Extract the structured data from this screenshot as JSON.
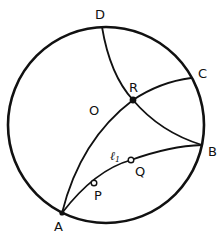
{
  "diagram": {
    "type": "hyperbolic-geometry-poincare-disk",
    "circle": {
      "cx": 106,
      "cy": 125,
      "r": 98,
      "stroke": "#111111",
      "stroke_width": 2.6
    },
    "points": {
      "A": {
        "label": "A",
        "x": 62,
        "y": 213,
        "lx": 54,
        "ly": 231
      },
      "B": {
        "label": "B",
        "x": 202,
        "y": 145,
        "lx": 208,
        "ly": 156
      },
      "C": {
        "label": "C",
        "x": 191,
        "y": 78,
        "lx": 198,
        "ly": 78
      },
      "D": {
        "label": "D",
        "x": 102,
        "y": 27,
        "lx": 95,
        "ly": 19
      },
      "R": {
        "label": "R",
        "x": 133,
        "y": 100,
        "lx": 129,
        "ly": 92
      },
      "O": {
        "label": "O",
        "lx": 89,
        "ly": 115
      },
      "P": {
        "label": "P",
        "x": 94,
        "y": 183,
        "lx": 94,
        "ly": 200
      },
      "Q": {
        "label": "Q",
        "x": 131,
        "y": 160,
        "lx": 135,
        "ly": 176
      }
    },
    "line_label": {
      "text": "ℓ",
      "subscript": "1",
      "x": 110,
      "y": 160
    },
    "curves": [
      {
        "name": "arc-D-R-B",
        "path": "M102,27 Q110,75 133,100 Q160,132 202,145"
      },
      {
        "name": "arc-A-R-C",
        "path": "M62,213 Q80,140 133,100 Q160,82 191,78"
      },
      {
        "name": "arc-l1-A-P-Q-B",
        "path": "M62,213 Q95,170 131,160 Q170,146 202,145"
      }
    ]
  }
}
